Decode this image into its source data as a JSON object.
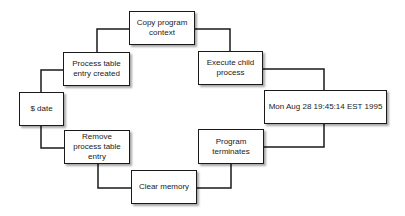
{
  "diagram": {
    "type": "process-cycle",
    "nodes": [
      {
        "id": "date",
        "label": "$ date"
      },
      {
        "id": "process_table",
        "label": "Process table entry created"
      },
      {
        "id": "copy_context",
        "label": "Copy program context"
      },
      {
        "id": "execute_child",
        "label": "Execute child process"
      },
      {
        "id": "output",
        "label": "Mon Aug 28 19:45:14 EST 1995"
      },
      {
        "id": "program_terminates",
        "label": "Program terminates"
      },
      {
        "id": "clear_memory",
        "label": "Clear memory"
      },
      {
        "id": "remove_entry",
        "label": "Remove process table entry"
      }
    ],
    "edges": [
      [
        "date",
        "process_table"
      ],
      [
        "process_table",
        "copy_context"
      ],
      [
        "copy_context",
        "execute_child"
      ],
      [
        "execute_child",
        "output"
      ],
      [
        "output",
        "program_terminates"
      ],
      [
        "program_terminates",
        "clear_memory"
      ],
      [
        "clear_memory",
        "remove_entry"
      ],
      [
        "remove_entry",
        "date"
      ]
    ],
    "colors": {
      "line": "#1a1a1a",
      "box_fill": "#ffffff"
    }
  }
}
